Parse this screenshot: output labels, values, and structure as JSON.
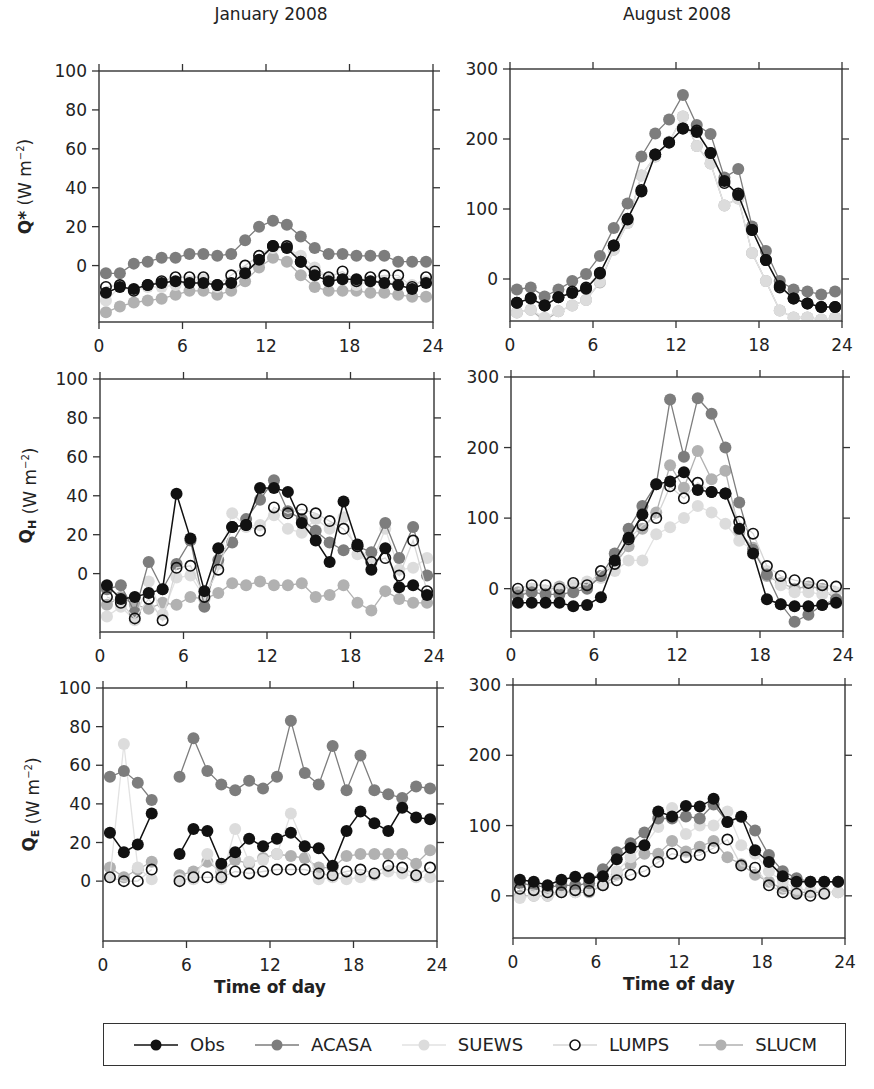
{
  "columns": [
    {
      "title": "January 2008"
    },
    {
      "title": "August 2008"
    }
  ],
  "xlabel": "Time of day",
  "legend": [
    {
      "name": "Obs",
      "fill": "#111111",
      "stroke": "#111111",
      "line": "#111111",
      "hollow": false
    },
    {
      "name": "ACASA",
      "fill": "#7d7d7d",
      "stroke": "#7d7d7d",
      "line": "#7d7d7d",
      "hollow": false
    },
    {
      "name": "SUEWS",
      "fill": "#dcdcdc",
      "stroke": "#dcdcdc",
      "line": "#e2e2e2",
      "hollow": false
    },
    {
      "name": "LUMPS",
      "fill": "#ffffff",
      "stroke": "#111111",
      "line": "#d6d6d6",
      "hollow": true
    },
    {
      "name": "SLUCM",
      "fill": "#b1b1b1",
      "stroke": "#b1b1b1",
      "line": "#b1b1b1",
      "hollow": false
    }
  ],
  "chart_data": [
    {
      "type": "line",
      "panel": "Jan Q*",
      "title": "January 2008",
      "ylabel": "Q* (W m-2)",
      "xlabel": "",
      "xlim": [
        0,
        24
      ],
      "ylim": [
        -29,
        100
      ],
      "xticks": [
        0,
        6,
        12,
        18,
        24
      ],
      "yticks": [
        0,
        20,
        40,
        60,
        80,
        100
      ],
      "x": [
        0.5,
        1.5,
        2.5,
        3.5,
        4.5,
        5.5,
        6.5,
        7.5,
        8.5,
        9.5,
        10.5,
        11.5,
        12.5,
        13.5,
        14.5,
        15.5,
        16.5,
        17.5,
        18.5,
        19.5,
        20.5,
        21.5,
        22.5,
        23.5
      ],
      "series": [
        {
          "name": "Obs",
          "values": [
            -14,
            -11,
            -12,
            -10,
            -9,
            -8,
            -9,
            -9,
            -10,
            -9,
            -4,
            3,
            10,
            9,
            2,
            -5,
            -8,
            -7,
            -7,
            -8,
            -9,
            -10,
            -12,
            -9
          ]
        },
        {
          "name": "ACASA",
          "values": [
            -4,
            -4,
            1,
            2,
            4,
            4,
            6,
            6,
            5,
            6,
            13,
            20,
            23,
            21,
            15,
            9,
            6,
            6,
            5,
            5,
            5,
            2,
            2,
            2
          ]
        },
        {
          "name": "SUEWS",
          "values": [
            -18,
            -11,
            -13,
            -11,
            -11,
            -10,
            -8,
            -7,
            -11,
            -9,
            -3,
            3,
            9,
            9,
            5,
            -1,
            -6,
            -7,
            -10,
            -8,
            -8,
            -9,
            -10,
            -8
          ]
        },
        {
          "name": "LUMPS",
          "values": [
            -11,
            -10,
            -13,
            -10,
            -8,
            -6,
            -6,
            -6,
            -10,
            -5,
            0,
            5,
            10,
            10,
            2,
            -3,
            -6,
            -3,
            -8,
            -6,
            -5,
            -5,
            -11,
            -6
          ]
        },
        {
          "name": "SLUCM",
          "values": [
            -24,
            -21,
            -19,
            -18,
            -17,
            -15,
            -13,
            -13,
            -15,
            -13,
            -8,
            -1,
            4,
            2,
            -5,
            -11,
            -13,
            -13,
            -13,
            -14,
            -14,
            -15,
            -16,
            -16
          ]
        }
      ]
    },
    {
      "type": "line",
      "panel": "Aug Q*",
      "title": "August 2008",
      "ylabel": "",
      "xlabel": "",
      "xlim": [
        0,
        24
      ],
      "ylim": [
        -60,
        300
      ],
      "xticks": [
        0,
        6,
        12,
        18,
        24
      ],
      "yticks": [
        0,
        100,
        200,
        300
      ],
      "x": [
        0.5,
        1.5,
        2.5,
        3.5,
        4.5,
        5.5,
        6.5,
        7.5,
        8.5,
        9.5,
        10.5,
        11.5,
        12.5,
        13.5,
        14.5,
        15.5,
        16.5,
        17.5,
        18.5,
        19.5,
        20.5,
        21.5,
        22.5,
        23.5
      ],
      "series": [
        {
          "name": "Obs",
          "values": [
            -34,
            -28,
            -38,
            -26,
            -20,
            -14,
            8,
            48,
            86,
            125,
            178,
            195,
            215,
            210,
            180,
            140,
            120,
            70,
            27,
            -10,
            -28,
            -35,
            -40,
            -40
          ]
        },
        {
          "name": "ACASA",
          "values": [
            -15,
            -12,
            -25,
            -15,
            -3,
            7,
            33,
            73,
            108,
            175,
            208,
            228,
            263,
            220,
            207,
            145,
            157,
            75,
            40,
            -3,
            -15,
            -18,
            -22,
            -18
          ]
        },
        {
          "name": "SUEWS",
          "values": [
            -48,
            -44,
            -55,
            -46,
            -38,
            -30,
            -4,
            42,
            80,
            148,
            175,
            196,
            232,
            190,
            165,
            105,
            115,
            37,
            -3,
            -45,
            -55,
            -55,
            -58,
            -55
          ]
        },
        {
          "name": "LUMPS",
          "values": [
            -34,
            -27,
            -38,
            -26,
            -18,
            -12,
            9,
            48,
            85,
            127,
            178,
            195,
            215,
            212,
            180,
            137,
            122,
            70,
            27,
            -12,
            -28,
            -35,
            -40,
            -40
          ]
        },
        {
          "name": "SLUCM",
          "values": [
            -48,
            -44,
            -60,
            -46,
            -38,
            -30,
            -5,
            42,
            80,
            148,
            175,
            196,
            232,
            190,
            165,
            105,
            115,
            37,
            -3,
            -45,
            -55,
            -55,
            -58,
            -55
          ]
        }
      ]
    },
    {
      "type": "line",
      "panel": "Jan QH",
      "title": "",
      "ylabel": "QH (W m-2)",
      "xlabel": "",
      "xlim": [
        0,
        24
      ],
      "ylim": [
        -30,
        100
      ],
      "xticks": [
        0,
        6,
        12,
        18,
        24
      ],
      "yticks": [
        0,
        20,
        40,
        60,
        80,
        100
      ],
      "x": [
        0.5,
        1.5,
        2.5,
        3.5,
        4.5,
        5.5,
        6.5,
        7.5,
        8.5,
        9.5,
        10.5,
        11.5,
        12.5,
        13.5,
        14.5,
        15.5,
        16.5,
        17.5,
        18.5,
        19.5,
        20.5,
        21.5,
        22.5,
        23.5
      ],
      "series": [
        {
          "name": "Obs",
          "values": [
            -6,
            -13,
            -12,
            -10,
            -8,
            41,
            18,
            -9,
            13,
            24,
            25,
            44,
            44,
            42,
            26,
            17,
            6,
            37,
            15,
            2,
            13,
            -7,
            -6,
            -11
          ]
        },
        {
          "name": "ACASA",
          "values": [
            -8,
            -6,
            -20,
            6,
            -8,
            5,
            17,
            -17,
            7,
            16,
            28,
            38,
            48,
            32,
            28,
            22,
            16,
            12,
            14,
            11,
            26,
            8,
            24,
            -1
          ]
        },
        {
          "name": "SUEWS",
          "values": [
            -22,
            -17,
            -24,
            -4,
            -21,
            -2,
            -1,
            -12,
            5,
            31,
            24,
            25,
            30,
            23,
            21,
            28,
            23,
            29,
            10,
            5,
            23,
            2,
            3,
            8
          ]
        },
        {
          "name": "LUMPS",
          "values": [
            -12,
            -15,
            -23,
            -13,
            -24,
            3,
            4,
            -12,
            2,
            24,
            25,
            22,
            34,
            31,
            33,
            31,
            27,
            23,
            14,
            6,
            8,
            -1,
            17,
            -9
          ]
        },
        {
          "name": "SLUCM",
          "values": [
            -16,
            -12,
            -16,
            -18,
            -15,
            -16,
            -12,
            -13,
            -10,
            -5,
            -6,
            -4,
            -6,
            -6,
            -5,
            -12,
            -11,
            -6,
            -15,
            -19,
            -9,
            -13,
            -15,
            -15
          ]
        }
      ]
    },
    {
      "type": "line",
      "panel": "Aug QH",
      "title": "",
      "ylabel": "",
      "xlabel": "",
      "xlim": [
        0,
        24
      ],
      "ylim": [
        -60,
        300
      ],
      "xticks": [
        0,
        6,
        12,
        18,
        24
      ],
      "yticks": [
        0,
        100,
        200,
        300
      ],
      "x": [
        0.5,
        1.5,
        2.5,
        3.5,
        4.5,
        5.5,
        6.5,
        7.5,
        8.5,
        9.5,
        10.5,
        11.5,
        12.5,
        13.5,
        14.5,
        15.5,
        16.5,
        17.5,
        18.5,
        19.5,
        20.5,
        21.5,
        22.5,
        23.5
      ],
      "series": [
        {
          "name": "Obs",
          "values": [
            -20,
            -20,
            -20,
            -20,
            -25,
            -23,
            -12,
            40,
            72,
            105,
            148,
            152,
            165,
            140,
            137,
            135,
            85,
            50,
            -15,
            -22,
            -25,
            -25,
            -23,
            -20
          ]
        },
        {
          "name": "ACASA",
          "values": [
            -10,
            -5,
            -8,
            -8,
            -5,
            0,
            18,
            50,
            85,
            117,
            148,
            268,
            187,
            270,
            248,
            200,
            122,
            55,
            20,
            -22,
            -47,
            -37,
            -23,
            -15
          ]
        },
        {
          "name": "SUEWS",
          "values": [
            -10,
            0,
            -3,
            0,
            5,
            10,
            15,
            25,
            40,
            40,
            77,
            87,
            100,
            117,
            108,
            92,
            68,
            55,
            25,
            5,
            -5,
            -5,
            -8,
            -5
          ]
        },
        {
          "name": "LUMPS",
          "values": [
            0,
            5,
            5,
            0,
            8,
            5,
            25,
            35,
            70,
            90,
            100,
            145,
            128,
            150,
            137,
            135,
            95,
            78,
            32,
            18,
            12,
            8,
            5,
            3
          ]
        },
        {
          "name": "SLUCM",
          "values": [
            -5,
            0,
            -3,
            3,
            0,
            3,
            18,
            35,
            60,
            85,
            108,
            175,
            143,
            195,
            155,
            167,
            80,
            58,
            18,
            8,
            0,
            3,
            0,
            -15
          ]
        }
      ]
    },
    {
      "type": "line",
      "panel": "Jan QE",
      "title": "",
      "ylabel": "QE (W m-2)",
      "xlabel": "Time of day",
      "xlim": [
        0,
        24
      ],
      "ylim": [
        -31,
        100
      ],
      "xticks": [
        0,
        6,
        12,
        18,
        24
      ],
      "yticks": [
        0,
        20,
        40,
        60,
        80,
        100
      ],
      "x": [
        0.5,
        1.5,
        2.5,
        3.5,
        4.5,
        5.5,
        6.5,
        7.5,
        8.5,
        9.5,
        10.5,
        11.5,
        12.5,
        13.5,
        14.5,
        15.5,
        16.5,
        17.5,
        18.5,
        19.5,
        20.5,
        21.5,
        22.5,
        23.5
      ],
      "series": [
        {
          "name": "Obs",
          "values": [
            25,
            15,
            19,
            35,
            null,
            14,
            27,
            26,
            9,
            15,
            22,
            18,
            22,
            25,
            18,
            17,
            8,
            26,
            36,
            30,
            26,
            38,
            33,
            32
          ]
        },
        {
          "name": "ACASA",
          "values": [
            54,
            57,
            51,
            42,
            null,
            54,
            74,
            57,
            50,
            47,
            52,
            48,
            54,
            83,
            56,
            50,
            70,
            47,
            65,
            47,
            45,
            43,
            49,
            48
          ]
        },
        {
          "name": "SUEWS",
          "values": [
            2,
            71,
            7,
            1,
            null,
            1,
            1,
            14,
            1,
            27,
            10,
            11,
            14,
            35,
            18,
            1,
            2,
            1,
            2,
            3,
            5,
            4,
            2,
            2
          ]
        },
        {
          "name": "LUMPS",
          "values": [
            2,
            0,
            0,
            6,
            null,
            0,
            2,
            2,
            2,
            5,
            4,
            5,
            6,
            6,
            6,
            4,
            3,
            5,
            6,
            4,
            8,
            7,
            3,
            7
          ]
        },
        {
          "name": "SLUCM",
          "values": [
            7,
            2,
            6,
            10,
            null,
            3,
            5,
            10,
            5,
            11,
            9,
            12,
            14,
            13,
            12,
            7,
            7,
            13,
            14,
            14,
            14,
            14,
            9,
            16
          ]
        }
      ]
    },
    {
      "type": "line",
      "panel": "Aug QE",
      "title": "",
      "ylabel": "",
      "xlabel": "Time of day",
      "xlim": [
        0,
        24
      ],
      "ylim": [
        -60,
        300
      ],
      "xticks": [
        0,
        6,
        12,
        18,
        24
      ],
      "yticks": [
        0,
        100,
        200,
        300
      ],
      "x": [
        0.5,
        1.5,
        2.5,
        3.5,
        4.5,
        5.5,
        6.5,
        7.5,
        8.5,
        9.5,
        10.5,
        11.5,
        12.5,
        13.5,
        14.5,
        15.5,
        16.5,
        17.5,
        18.5,
        19.5,
        20.5,
        21.5,
        22.5,
        23.5
      ],
      "series": [
        {
          "name": "Obs",
          "values": [
            23,
            20,
            15,
            23,
            27,
            25,
            28,
            52,
            68,
            72,
            120,
            113,
            128,
            127,
            138,
            105,
            113,
            65,
            48,
            28,
            20,
            20,
            20,
            20
          ]
        },
        {
          "name": "ACASA",
          "values": [
            18,
            15,
            12,
            15,
            15,
            18,
            38,
            62,
            75,
            90,
            110,
            110,
            113,
            110,
            130,
            105,
            112,
            93,
            58,
            35,
            25,
            20,
            20,
            20
          ]
        },
        {
          "name": "SUEWS",
          "values": [
            -3,
            0,
            0,
            5,
            5,
            10,
            18,
            35,
            55,
            72,
            98,
            125,
            88,
            100,
            100,
            120,
            72,
            60,
            35,
            20,
            10,
            8,
            5,
            5
          ]
        },
        {
          "name": "LUMPS",
          "values": [
            10,
            8,
            5,
            5,
            8,
            7,
            15,
            22,
            30,
            35,
            48,
            60,
            55,
            58,
            68,
            80,
            43,
            40,
            15,
            5,
            3,
            0,
            3,
            null
          ]
        },
        {
          "name": "SLUCM",
          "values": [
            0,
            0,
            0,
            5,
            5,
            5,
            15,
            30,
            45,
            60,
            60,
            78,
            63,
            70,
            78,
            55,
            45,
            30,
            20,
            10,
            5,
            5,
            5,
            5
          ]
        }
      ]
    }
  ]
}
